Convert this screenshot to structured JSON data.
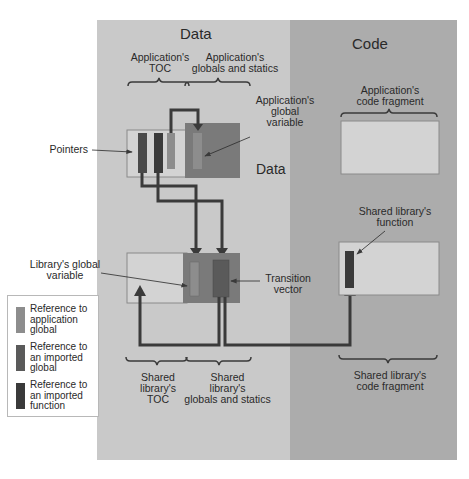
{
  "colors": {
    "data_bg": "#c9c9c9",
    "code_bg": "#acacac",
    "box_light": "#d3d3d3",
    "box_border": "#8a8a8a",
    "globals_block": "#7a7a7a",
    "ref_app_global": "#8d8d8d",
    "ref_imported_global": "#5a5a5a",
    "ref_imported_function": "#3a3a3a",
    "arrow": "#3a3a3a"
  },
  "headings": {
    "data": "Data",
    "code": "Code",
    "data_inner": "Data"
  },
  "labels": {
    "app_toc": "Application's\nTOC",
    "app_globals": "Application's\nglobals and statics",
    "app_global_variable": "Application's\nglobal\nvariable",
    "pointers": "Pointers",
    "app_code_fragment": "Application's\ncode fragment",
    "lib_global_variable": "Library's global\nvariable",
    "transition_vector": "Transition\nvector",
    "lib_function": "Shared library's\nfunction",
    "lib_toc": "Shared\nlibrary's\nTOC",
    "lib_globals": "Shared\nlibrary's\nglobals and statics",
    "lib_code_fragment": "Shared library's\ncode fragment"
  },
  "legend": {
    "items": [
      {
        "label": "Reference to\napplication\nglobal",
        "color": "#8d8d8d"
      },
      {
        "label": "Reference to\nan imported\nglobal",
        "color": "#5a5a5a"
      },
      {
        "label": "Reference to\nan imported\nfunction",
        "color": "#3a3a3a"
      }
    ]
  }
}
